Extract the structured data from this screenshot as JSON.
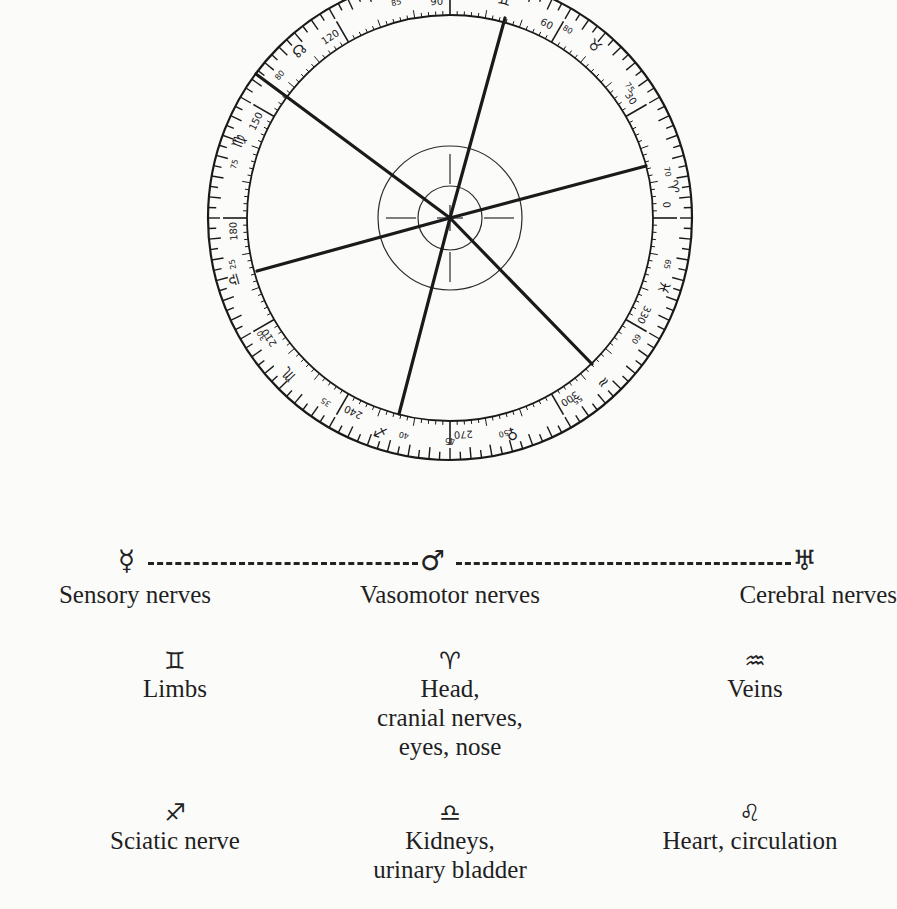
{
  "figure": {
    "dial": {
      "center": [
        450,
        218
      ],
      "radii": {
        "outer": 242,
        "scale_inner": 203,
        "hub_outer": 72,
        "hub_inner": 32
      },
      "inner_scale_labels": [
        {
          "deg": 0,
          "label": "0"
        },
        {
          "deg": 30,
          "label": "30"
        },
        {
          "deg": 60,
          "label": "60"
        },
        {
          "deg": 90,
          "label": "90"
        },
        {
          "deg": 120,
          "label": "120"
        },
        {
          "deg": 150,
          "label": "150"
        },
        {
          "deg": 180,
          "label": "180"
        },
        {
          "deg": 210,
          "label": "210"
        },
        {
          "deg": 240,
          "label": "240"
        },
        {
          "deg": 270,
          "label": "270"
        },
        {
          "deg": 300,
          "label": "300"
        },
        {
          "deg": 330,
          "label": "330"
        }
      ],
      "outer_scale_labels": [
        {
          "deg": 12,
          "label": "70"
        },
        {
          "deg": 36,
          "label": "75"
        },
        {
          "deg": 58,
          "label": "80"
        },
        {
          "deg": 104,
          "label": "85"
        },
        {
          "deg": 140,
          "label": "80"
        },
        {
          "deg": 166,
          "label": "75"
        },
        {
          "deg": 192,
          "label": "25"
        },
        {
          "deg": 212,
          "label": "30"
        },
        {
          "deg": 236,
          "label": "35"
        },
        {
          "deg": 258,
          "label": "40"
        },
        {
          "deg": 270,
          "label": "45"
        },
        {
          "deg": 284,
          "label": "50"
        },
        {
          "deg": 305,
          "label": "55"
        },
        {
          "deg": 327,
          "label": "60"
        },
        {
          "deg": 348,
          "label": "65"
        }
      ],
      "sign_glyphs": [
        {
          "deg": 8,
          "glyph": "♈",
          "name": "aries"
        },
        {
          "deg": 50,
          "glyph": "♉",
          "name": "taurus"
        },
        {
          "deg": 76,
          "glyph": "♊",
          "name": "gemini"
        },
        {
          "deg": 98,
          "glyph": "♋",
          "name": "cancer"
        },
        {
          "deg": 132,
          "glyph": "☊",
          "name": "ascending-node"
        },
        {
          "deg": 160,
          "glyph": "♍",
          "name": "virgo"
        },
        {
          "deg": 196,
          "glyph": "♎",
          "name": "libra"
        },
        {
          "deg": 224,
          "glyph": "♏",
          "name": "scorpio"
        },
        {
          "deg": 252,
          "glyph": "♐",
          "name": "sagittarius"
        },
        {
          "deg": 286,
          "glyph": "♀",
          "name": "venus"
        },
        {
          "deg": 313,
          "glyph": "≈",
          "name": "aquarius"
        },
        {
          "deg": 342,
          "glyph": "♓",
          "name": "pisces"
        }
      ],
      "pointer_lines": [
        {
          "name": "line-ascending-node",
          "end": [
            256,
            74
          ]
        },
        {
          "name": "line-gemini",
          "end": [
            505,
            18
          ]
        },
        {
          "name": "line-aries",
          "end": [
            646,
            166
          ]
        },
        {
          "name": "line-aquarius",
          "end": [
            592,
            364
          ]
        },
        {
          "name": "line-sagittarius",
          "end": [
            399,
            414
          ]
        },
        {
          "name": "line-libra",
          "end": [
            257,
            271
          ]
        }
      ]
    },
    "planet_row": {
      "left_glyph": "☿",
      "middle_glyph": "♂",
      "right_glyph": "♅",
      "labels": [
        "Sensory nerves",
        "Vasomotor nerves",
        "Cerebral nerves"
      ]
    },
    "sign_rows": [
      [
        {
          "glyph": "♊",
          "lines": [
            "Limbs"
          ]
        },
        {
          "glyph": "♈",
          "lines": [
            "Head,",
            "cranial nerves,",
            "eyes, nose"
          ]
        },
        {
          "glyph": "♒",
          "lines": [
            "Veins"
          ]
        }
      ],
      [
        {
          "glyph": "♐",
          "lines": [
            "Sciatic nerve"
          ]
        },
        {
          "glyph": "♎",
          "lines": [
            "Kidneys,",
            "urinary bladder"
          ]
        },
        {
          "glyph": "♌",
          "lines": [
            "Heart, circulation"
          ]
        }
      ]
    ]
  }
}
